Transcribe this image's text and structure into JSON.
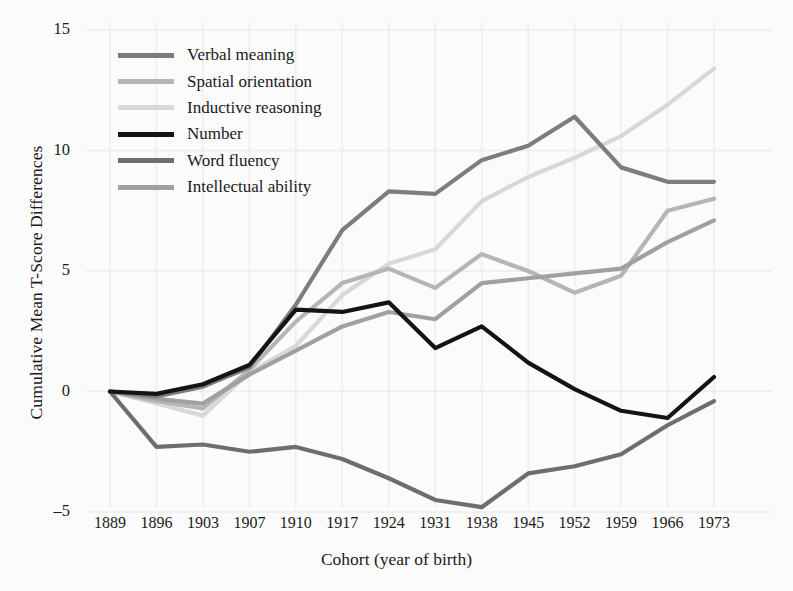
{
  "chart_data": {
    "type": "line",
    "title": "",
    "subtitle": "",
    "xlabel": "Cohort (year of birth)",
    "ylabel": "Cumulative Mean T-Score Differences",
    "categories": [
      "1889",
      "1896",
      "1903",
      "1907",
      "1910",
      "1917",
      "1924",
      "1931",
      "1938",
      "1945",
      "1952",
      "1959",
      "1966",
      "1973"
    ],
    "x_tick_labels": [
      "1889",
      "1896",
      "1903",
      "1907",
      "1910",
      "1917",
      "1924",
      "1931",
      "1938",
      "1945",
      "1952",
      "1959",
      "1966",
      "1973"
    ],
    "y_tick_labels": [
      "15",
      "10",
      "5",
      "0",
      "–5"
    ],
    "y_tick_values": [
      15,
      10,
      5,
      0,
      -5
    ],
    "ylim": [
      -5.6,
      15.4
    ],
    "grid": true,
    "legend_position": "upper-left",
    "series": [
      {
        "name": "Verbal meaning",
        "color": "#7d7d7d",
        "width": 4.2,
        "values": [
          0.0,
          -0.2,
          0.2,
          1.0,
          3.6,
          6.7,
          8.3,
          8.2,
          9.6,
          10.2,
          11.4,
          9.3,
          8.7,
          8.7
        ]
      },
      {
        "name": "Spatial orientation",
        "color": "#b5b5b5",
        "width": 4.2,
        "values": [
          0.0,
          -0.4,
          -0.7,
          0.9,
          2.9,
          4.5,
          5.1,
          4.3,
          5.7,
          5.0,
          4.1,
          4.8,
          7.5,
          8.0
        ]
      },
      {
        "name": "Inductive reasoning",
        "color": "#d8d8d8",
        "width": 4.2,
        "values": [
          0.0,
          -0.5,
          -1.0,
          0.8,
          1.9,
          4.0,
          5.3,
          5.9,
          7.9,
          8.9,
          9.7,
          10.6,
          11.9,
          13.4
        ]
      },
      {
        "name": "Number",
        "color": "#141414",
        "width": 4.2,
        "values": [
          0.0,
          -0.1,
          0.3,
          1.1,
          3.4,
          3.3,
          3.7,
          1.8,
          2.7,
          1.2,
          0.1,
          -0.8,
          -1.1,
          0.6
        ]
      },
      {
        "name": "Word fluency",
        "color": "#6e6e6e",
        "width": 4.2,
        "values": [
          0.0,
          -2.3,
          -2.2,
          -2.5,
          -2.3,
          -2.8,
          -3.6,
          -4.5,
          -4.8,
          -3.4,
          -3.1,
          -2.6,
          -1.4,
          -0.4
        ]
      },
      {
        "name": "Intellectual ability",
        "color": "#a0a0a0",
        "width": 4.2,
        "values": [
          0.0,
          -0.3,
          -0.5,
          0.7,
          1.7,
          2.7,
          3.3,
          3.0,
          4.5,
          4.7,
          4.9,
          5.1,
          6.2,
          7.1
        ]
      }
    ]
  },
  "legend": {
    "items": [
      {
        "label": "Verbal meaning",
        "color": "#7d7d7d"
      },
      {
        "label": "Spatial orientation",
        "color": "#b5b5b5"
      },
      {
        "label": "Inductive reasoning",
        "color": "#d8d8d8"
      },
      {
        "label": "Number",
        "color": "#141414"
      },
      {
        "label": "Word fluency",
        "color": "#6e6e6e"
      },
      {
        "label": "Intellectual ability",
        "color": "#a0a0a0"
      }
    ]
  },
  "axes": {
    "y_title": "Cumulative Mean T-Score Differences",
    "x_title": "Cohort (year of birth)",
    "grid_color": "#ececec"
  }
}
